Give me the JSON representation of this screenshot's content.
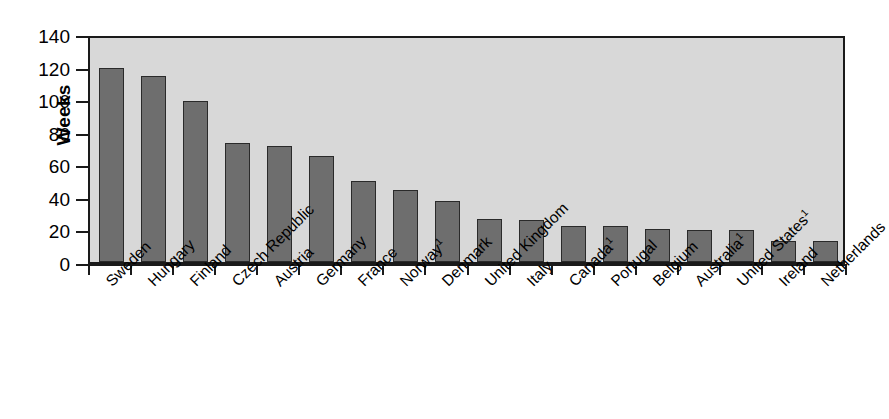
{
  "chart_data": {
    "type": "bar",
    "title": "",
    "subtitle": "",
    "xlabel": "",
    "ylabel": "Weeks",
    "ylim": [
      0,
      140
    ],
    "ytick_step": 20,
    "yticks": [
      0,
      20,
      40,
      60,
      80,
      100,
      120,
      140
    ],
    "grid": false,
    "legend": null,
    "orientation": "vertical",
    "bar_color": "#6e6e6e",
    "bar_edge_color": "#2a2a2a",
    "plot_background": "#d8d8d8",
    "axis_color": "#1a1a1a",
    "categories": [
      "Sweden",
      "Hungary",
      "Finland",
      "Czech Republic",
      "Austria",
      "Germany",
      "France",
      "Norway",
      "Denmark",
      "United Kingdom",
      "Italy",
      "Canada",
      "Portugal",
      "Belgium",
      "Australia",
      "United States",
      "Ireland",
      "Netherlands"
    ],
    "category_footnotes": {
      "Norway": "1",
      "Canada": "1",
      "Australia": "1",
      "United States": "1"
    },
    "values": [
      119,
      114,
      99,
      73,
      71,
      65,
      49.5,
      44.5,
      37.5,
      26.5,
      26,
      22,
      22,
      20.5,
      19.5,
      19.5,
      13,
      13
    ]
  },
  "axis": {
    "y_title": "Weeks",
    "y_tick_labels": [
      "140",
      "120",
      "100",
      "80",
      "60",
      "40",
      "20",
      "0"
    ],
    "category_labels": [
      "Sweden",
      "Hungary",
      "Finland",
      "Czech Republic",
      "Austria",
      "Germany",
      "France",
      "Norway¹",
      "Denmark",
      "United Kingdom",
      "Italy",
      "Canada¹",
      "Portugal",
      "Belgium",
      "Australia¹",
      "United States¹",
      "Ireland",
      "Netherlands"
    ]
  }
}
